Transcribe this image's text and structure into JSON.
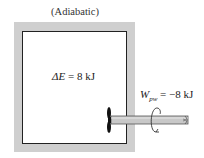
{
  "diagram": {
    "title": "(Adiabatic)",
    "system": {
      "energy_change_symbol": "ΔE",
      "energy_change_value": "= 8 kJ"
    },
    "work": {
      "symbol": "W",
      "subscript": "pw",
      "value": "= −8 kJ"
    },
    "components": [
      "adiabatic-wall",
      "paddle-wheel",
      "shaft",
      "rotation-arrow"
    ],
    "colors": {
      "wall": "#cfcfcf",
      "outline": "#222222",
      "shaft": "#c8c8c8"
    }
  }
}
